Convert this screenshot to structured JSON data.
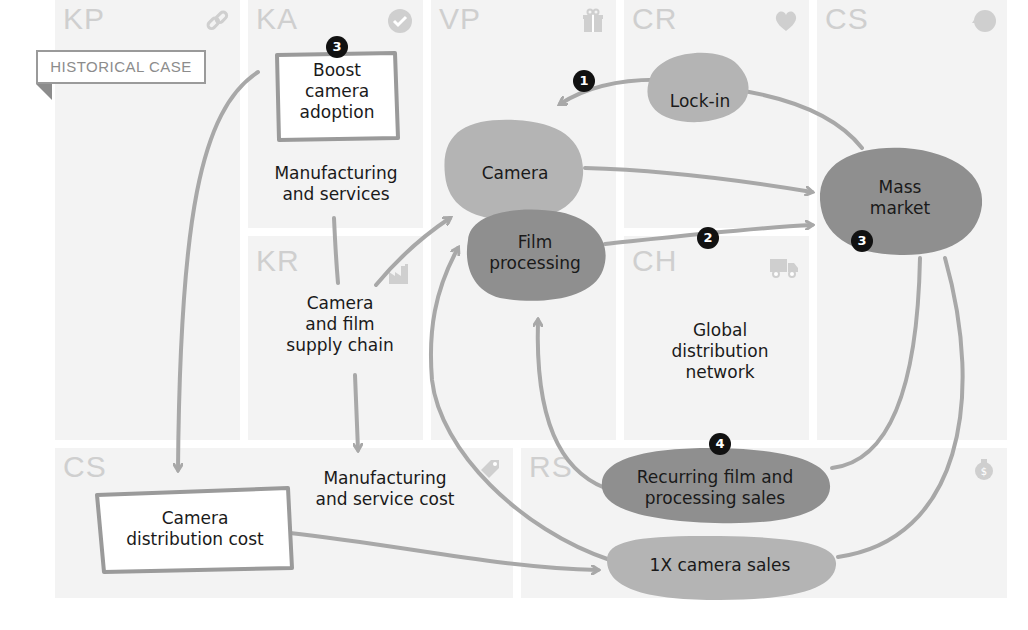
{
  "tag": {
    "label": "HISTORICAL CASE"
  },
  "blocks": [
    {
      "id": "KP",
      "label": "KP",
      "icon": "link-icon"
    },
    {
      "id": "KA",
      "label": "KA",
      "icon": "checkmark-icon"
    },
    {
      "id": "KR",
      "label": "KR",
      "icon": "factory-icon"
    },
    {
      "id": "VP",
      "label": "VP",
      "icon": "gift-icon"
    },
    {
      "id": "CR",
      "label": "CR",
      "icon": "heart-icon"
    },
    {
      "id": "CH",
      "label": "CH",
      "icon": "truck-icon"
    },
    {
      "id": "CS_top",
      "label": "CS",
      "icon": "head-icon"
    },
    {
      "id": "CS_bottom",
      "label": "CS",
      "icon": "price-tag-icon"
    },
    {
      "id": "RS",
      "label": "RS",
      "icon": "money-bag-icon"
    }
  ],
  "nodes": {
    "boost": {
      "text": [
        "Boost",
        "camera",
        "adoption"
      ],
      "badge": "3"
    },
    "manufacturing_services": {
      "text": [
        "Manufacturing",
        "and services"
      ]
    },
    "supply_chain": {
      "text": [
        "Camera",
        "and film",
        "supply chain"
      ]
    },
    "camera": {
      "text": [
        "Camera"
      ]
    },
    "film": {
      "text": [
        "Film",
        "processing"
      ]
    },
    "lockin": {
      "text": [
        "Lock-in"
      ]
    },
    "mass_market": {
      "text": [
        "Mass",
        "market"
      ],
      "badge": "3"
    },
    "global_distribution": {
      "text": [
        "Global",
        "distribution",
        "network"
      ]
    },
    "recurring": {
      "text": [
        "Recurring film and",
        "processing sales"
      ],
      "badge": "4"
    },
    "camera_sales": {
      "text": [
        "1X camera sales"
      ]
    },
    "camera_dist_cost": {
      "text": [
        "Camera",
        "distribution cost"
      ]
    },
    "mfg_service_cost": {
      "text": [
        "Manufacturing",
        "and service cost"
      ]
    }
  },
  "arrow_badges": {
    "lockin_arrow": "1",
    "film_arrow": "2"
  },
  "colors": {
    "block_bg": "#f3f3f3",
    "block_label": "#cfcfcf",
    "light_blob": "#b4b4b4",
    "dark_blob": "#8f8f8f",
    "arrow": "#a8a8a8",
    "badge": "#111111"
  }
}
